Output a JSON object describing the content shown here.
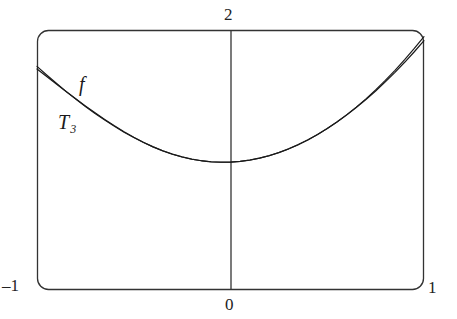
{
  "figure": {
    "kind": "math-function-plot",
    "background_color": "#ffffff",
    "ink_color": "#1a1a1a",
    "frame": {
      "x": 37,
      "y": 30,
      "width": 387,
      "height": 260,
      "corner_radius": 11,
      "stroke_color": "#333333",
      "stroke_width": 1.3
    },
    "vertical_axis": {
      "x": 231,
      "y_top": 30,
      "y_bottom": 290,
      "stroke_color": "#333333",
      "stroke_width": 1.3
    }
  },
  "labels": {
    "top": "2",
    "left": "–1",
    "bottom": "0",
    "right": "1",
    "curve_f": "f",
    "curve_t3": "T",
    "curve_t3_sub": "3"
  },
  "chart_data": {
    "type": "line",
    "title": "",
    "xlabel": "",
    "ylabel": "",
    "xlim": [
      -1,
      1
    ],
    "ylim": [
      0,
      2
    ],
    "xticks": [
      -1,
      0,
      1
    ],
    "xticklabels": [
      "–1",
      "0",
      "1"
    ],
    "yticks": [
      2
    ],
    "yticklabels": [
      "2"
    ],
    "grid": false,
    "legend": "inline-curve-labels",
    "annotations": [
      {
        "text": "f",
        "x": -0.77,
        "y": 1.44,
        "style": "italic"
      },
      {
        "text": "T3",
        "x": -0.88,
        "y": 1.16,
        "style": "italic-subscript"
      }
    ],
    "x": [
      -1.0,
      -0.95,
      -0.9,
      -0.85,
      -0.8,
      -0.75,
      -0.7,
      -0.65,
      -0.6,
      -0.55,
      -0.5,
      -0.45,
      -0.4,
      -0.35,
      -0.3,
      -0.25,
      -0.2,
      -0.15,
      -0.1,
      -0.05,
      0.0,
      0.05,
      0.1,
      0.15,
      0.2,
      0.25,
      0.3,
      0.35,
      0.4,
      0.45,
      0.5,
      0.55,
      0.6,
      0.65,
      0.7,
      0.75,
      0.8,
      0.85,
      0.9,
      0.95,
      1.0
    ],
    "series": [
      {
        "name": "f",
        "label": "f",
        "stroke_color": "#1a1a1a",
        "stroke_width": 1.2,
        "values": [
          1.72,
          1.654,
          1.59,
          1.528,
          1.469,
          1.412,
          1.358,
          1.307,
          1.259,
          1.214,
          1.173,
          1.135,
          1.101,
          1.071,
          1.045,
          1.024,
          1.007,
          0.9945,
          0.9865,
          0.983,
          0.984,
          0.9895,
          0.9995,
          1.014,
          1.033,
          1.0565,
          1.0845,
          1.117,
          1.154,
          1.1955,
          1.2415,
          1.292,
          1.347,
          1.4065,
          1.4705,
          1.539,
          1.612,
          1.6895,
          1.7715,
          1.858,
          1.949
        ]
      },
      {
        "name": "T3",
        "label": "T 3",
        "stroke_color": "#1a1a1a",
        "stroke_width": 1.2,
        "values": [
          1.7,
          1.642,
          1.584,
          1.527,
          1.471,
          1.416,
          1.363,
          1.312,
          1.263,
          1.217,
          1.175,
          1.136,
          1.101,
          1.07,
          1.044,
          1.023,
          1.006,
          0.994,
          0.9862,
          0.9828,
          0.984,
          0.9896,
          0.9998,
          1.0146,
          1.034,
          1.0578,
          1.086,
          1.1186,
          1.1556,
          1.1968,
          1.2422,
          1.2918,
          1.3456,
          1.4034,
          1.4652,
          1.531,
          1.6006,
          1.6742,
          1.7516,
          1.8328,
          1.918
        ]
      }
    ]
  }
}
